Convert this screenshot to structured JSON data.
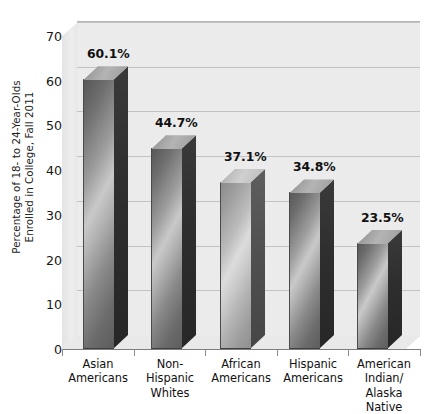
{
  "chart_data": {
    "type": "bar",
    "title": "",
    "subtitle": "",
    "xlabel": "",
    "ylabel": "Percentage of 18- to 24-Year-Olds Enrolled in College, Fall 2011",
    "ylabel_lines": [
      "Percentage of 18- to 24-Year-Olds",
      "Enrolled in College, Fall 2011"
    ],
    "categories": [
      "Asian Americans",
      "Non-Hispanic Whites",
      "African Americans",
      "Hispanic Americans",
      "American Indian/ Alaska Native"
    ],
    "category_lines": [
      [
        "Asian",
        "Americans"
      ],
      [
        "Non-Hispanic",
        "Whites"
      ],
      [
        "African",
        "Americans"
      ],
      [
        "Hispanic",
        "Americans"
      ],
      [
        "American",
        "Indian/",
        "Alaska",
        "Native"
      ]
    ],
    "values": [
      60.1,
      44.7,
      37.1,
      34.8,
      23.5
    ],
    "data_labels": [
      "60.1%",
      "44.7%",
      "37.1%",
      "34.8%",
      "23.5%"
    ],
    "ylim": [
      0,
      70
    ],
    "yticks": [
      0,
      10,
      20,
      30,
      40,
      50,
      60,
      70
    ],
    "ytick_labels": [
      "0",
      "10",
      "20",
      "30",
      "40",
      "50",
      "60",
      "70"
    ],
    "grid": true,
    "grid_axis": "y",
    "legend": false,
    "legend_position": "none",
    "style": "3d-column-grayscale"
  },
  "colors": {
    "plot_background": "#ececed",
    "gridline": "#c3c3c3",
    "axis_line": "#7d7d7d",
    "bar_dark": "#5d5d5d",
    "bar_light": "#c9c9c9",
    "bar_side": "#2e2e2e",
    "bar_top": "#b4b4b4",
    "text": "#161616",
    "page_background": "#ffffff"
  }
}
